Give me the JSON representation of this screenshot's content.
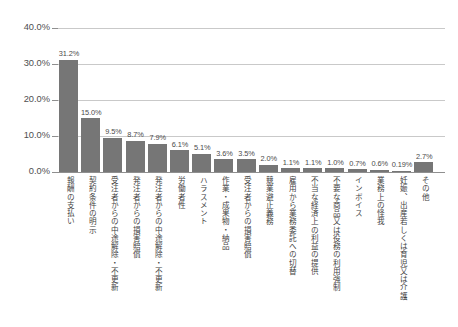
{
  "chart_data": {
    "type": "bar",
    "title": "",
    "subtitle": "",
    "xlabel": "",
    "ylabel": "",
    "ylim": [
      0,
      40
    ],
    "grid": true,
    "legend": false,
    "legend_position": "none",
    "bar_color": "#767676",
    "gridline_color": "#c9c9c9",
    "axis_color": "#8f8f8f",
    "y_ticks": [
      "0.0%",
      "10.0%",
      "20.0%",
      "30.0%",
      "40.0%"
    ],
    "y_tick_values": [
      0,
      10,
      20,
      30,
      40
    ],
    "categories": [
      "報酬の支払い",
      "契約条件の明示",
      "受注者からの中途解除・不更新",
      "発注者からの損害賠償",
      "発注者からの中途解除・不更新",
      "労働者性",
      "ハラスメント",
      "作業・成果物・納品",
      "受注者からの損害賠償",
      "競業避止義務",
      "雇用から業務委託への切替",
      "不当な経済上の利益の提供",
      "不要な商品又は役務の利用強制",
      "インボイス",
      "業務上の怪我",
      "妊娠、出産若しくは育児又は介護",
      "その他"
    ],
    "values": [
      31.2,
      15.0,
      9.5,
      8.7,
      7.9,
      6.1,
      5.1,
      3.6,
      3.5,
      2.0,
      1.1,
      1.1,
      1.0,
      0.7,
      0.6,
      0.19,
      2.7
    ],
    "value_labels": [
      "31.2%",
      "15.0%",
      "9.5%",
      "8.7%",
      "7.9%",
      "6.1%",
      "5.1%",
      "3.6%",
      "3.5%",
      "2.0%",
      "1.1%",
      "1.1%",
      "1.0%",
      "0.7%",
      "0.6%",
      "0.19%",
      "2.7%"
    ]
  }
}
